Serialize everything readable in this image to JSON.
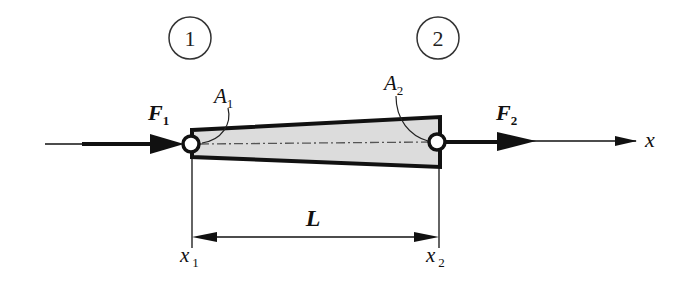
{
  "diagram": {
    "colors": {
      "ink": "#111111",
      "bar_fill": "#dcdcdc",
      "background": "#ffffff"
    },
    "nodes": [
      {
        "id": "1",
        "label": "1"
      },
      {
        "id": "2",
        "label": "2"
      }
    ],
    "forces": [
      {
        "symbol": "F",
        "subscript": "1"
      },
      {
        "symbol": "F",
        "subscript": "2"
      }
    ],
    "areas": [
      {
        "symbol": "A",
        "subscript": "1"
      },
      {
        "symbol": "A",
        "subscript": "2"
      }
    ],
    "coordinates": [
      {
        "symbol": "x",
        "subscript": "1"
      },
      {
        "symbol": "x",
        "subscript": "2"
      }
    ],
    "axis_label": "x",
    "length_label": "L"
  }
}
